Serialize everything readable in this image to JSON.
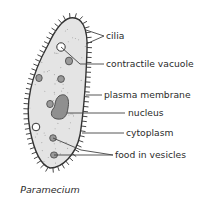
{
  "diagram": {
    "title": "Paramecium",
    "colors": {
      "body_fill": "#e4e4e4",
      "outline": "#333333",
      "vesicle_fill": "#9a9a9a",
      "nucleus_fill": "#8f8f8f",
      "vacuole_fill": "#ffffff",
      "leader_line": "#444444",
      "text": "#2b2b2b"
    },
    "labels": [
      {
        "id": "cilia",
        "text": "cilia"
      },
      {
        "id": "contractile-vacuole",
        "text": "contractile vacuole"
      },
      {
        "id": "plasma-membrane",
        "text": "plasma membrane"
      },
      {
        "id": "nucleus",
        "text": "nucleus"
      },
      {
        "id": "cytoplasm",
        "text": "cytoplasm"
      },
      {
        "id": "food-in-vesicles",
        "text": "food in vesicles"
      }
    ]
  }
}
